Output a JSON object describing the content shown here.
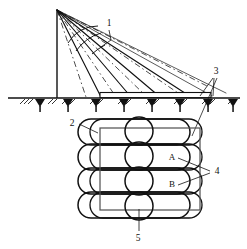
{
  "figure": {
    "title": "",
    "background_color": "#ffffff",
    "line_color": "#111111",
    "width": 247,
    "height": 249
  },
  "labels": {
    "callout_1": "1",
    "callout_2": "2",
    "callout_3": "3",
    "callout_4": "4",
    "callout_5": "5",
    "point_a": "A",
    "point_b": "B"
  },
  "upper_view": {
    "name": "elevation-view",
    "description": "Mast with fan of rays to ground line with hatched supports",
    "mast": {
      "x": 57,
      "top_y": 10,
      "bottom_y": 98
    },
    "apex": {
      "x": 57,
      "y": 10
    },
    "ground_line": {
      "y": 98,
      "x_start": 8,
      "x_end": 240
    },
    "platform": {
      "x_start": 100,
      "x_end": 211,
      "y_top": 92,
      "y_bottom": 98
    },
    "ray_endpoints_x": [
      57,
      101,
      131,
      160,
      191,
      212
    ],
    "dashed_ray_endpoints_x": [
      85,
      116,
      146,
      176,
      206
    ],
    "support_count": 8,
    "arc_count": 3
  },
  "lower_view": {
    "name": "plan-view",
    "description": "Overlapping stadium shapes in rows with vertical lens column and bounding rectangle",
    "rows": 4,
    "row_y": [
      132,
      157,
      181,
      205
    ],
    "stadium": {
      "x_left": 78,
      "x_right": 190,
      "height": 26,
      "radius": 13
    },
    "rectangle": {
      "x": 100,
      "y": 128,
      "width": 100,
      "height": 82
    },
    "lens_column_x": 139,
    "lens_count": 4
  },
  "leaders": {
    "callout_1": {
      "text_x": 109,
      "text_y": 24,
      "to_x": 102,
      "to_y": 47
    },
    "callout_2": {
      "text_x": 73,
      "text_y": 124,
      "to_x": 97,
      "to_y": 133
    },
    "callout_3": {
      "text_x": 215,
      "text_y": 72,
      "to_x": 205,
      "to_y": 96
    },
    "callout_4": {
      "text_x": 216,
      "text_y": 172,
      "to_a_x": 181,
      "to_a_y": 159,
      "to_b_x": 181,
      "to_b_y": 186
    },
    "callout_5": {
      "text_x": 137,
      "text_y": 238,
      "to_x": 139,
      "to_y": 210
    },
    "point_a": {
      "text_x": 172,
      "text_y": 158
    },
    "point_b": {
      "text_x": 172,
      "text_y": 185
    }
  }
}
